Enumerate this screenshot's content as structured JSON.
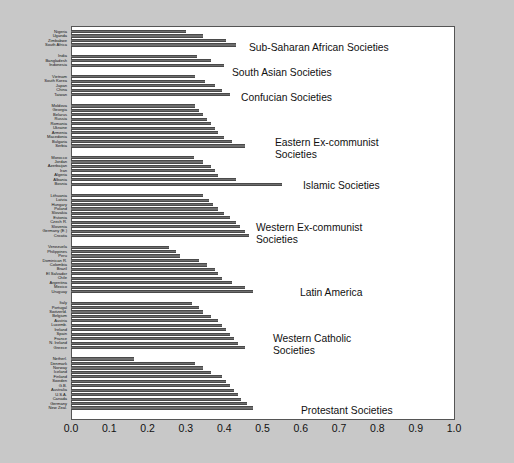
{
  "chart_data": {
    "type": "bar",
    "orientation": "horizontal",
    "title": "",
    "xlabel": "",
    "ylabel": "",
    "xlim": [
      0.0,
      1.0
    ],
    "grid": false,
    "legend": "none",
    "xticks": [
      "0.0",
      "0.1",
      "0.2",
      "0.3",
      "0.4",
      "0.5",
      "0.6",
      "0.7",
      "0.8",
      "0.9",
      "1.0"
    ],
    "xtick_values": [
      0.0,
      0.1,
      0.2,
      0.3,
      0.4,
      0.5,
      0.6,
      0.7,
      0.8,
      0.9,
      1.0
    ],
    "bar_color": "#6e6e6e",
    "groups": [
      {
        "name": "Sub-Saharan African Societies",
        "annotation": "Sub-Saharan African Societies",
        "categories": [
          "Nigeria",
          "Uganda",
          "Zimbabwe",
          "South Africa"
        ],
        "values": [
          0.3,
          0.345,
          0.405,
          0.43
        ]
      },
      {
        "name": "South Asian Societies",
        "annotation": "South Asian Societies",
        "categories": [
          "India",
          "Bangladesh",
          "Indonesia"
        ],
        "values": [
          0.33,
          0.365,
          0.4
        ]
      },
      {
        "name": "Confucian Societies",
        "annotation": "Confucian Societies",
        "categories": [
          "Vietnam",
          "South Korea",
          "Japan",
          "China",
          "Taiwan"
        ],
        "values": [
          0.325,
          0.35,
          0.375,
          0.395,
          0.415
        ]
      },
      {
        "name": "Eastern Ex-communist Societies",
        "annotation": "Eastern Ex-communist\nSocieties",
        "categories": [
          "Moldova",
          "Georgia",
          "Belarus",
          "Russia",
          "Romania",
          "Ukraine",
          "Armenia",
          "Macedonia",
          "Bulgaria",
          "Serbia"
        ],
        "values": [
          0.325,
          0.335,
          0.345,
          0.355,
          0.365,
          0.375,
          0.385,
          0.4,
          0.42,
          0.455
        ]
      },
      {
        "name": "Islamic Societies",
        "annotation": "Islamic Societies",
        "categories": [
          "Morocco",
          "Jordan",
          "Azerbaijan",
          "Iran",
          "Algeria",
          "Albania",
          "Bosnia"
        ],
        "values": [
          0.32,
          0.345,
          0.365,
          0.375,
          0.385,
          0.43,
          0.55
        ]
      },
      {
        "name": "Western Ex-communist Societies",
        "annotation": "Western Ex-communist\nSocieties",
        "categories": [
          "Lithuania",
          "Latvia",
          "Hungary",
          "Poland",
          "Slovakia",
          "Estonia",
          "Czech R.",
          "Slovenia",
          "Germany (E.)",
          "Croatia"
        ],
        "values": [
          0.345,
          0.36,
          0.37,
          0.385,
          0.4,
          0.415,
          0.43,
          0.44,
          0.455,
          0.465
        ]
      },
      {
        "name": "Latin America",
        "annotation": "Latin America",
        "categories": [
          "Venezuela",
          "Philippines",
          "Peru",
          "Dominican R.",
          "Colombia",
          "Brazil",
          "El Salvador",
          "Chile",
          "Argentina",
          "Mexico",
          "Uruguay"
        ],
        "values": [
          0.255,
          0.275,
          0.285,
          0.335,
          0.355,
          0.375,
          0.385,
          0.395,
          0.42,
          0.455,
          0.475
        ]
      },
      {
        "name": "Western Catholic Societies",
        "annotation": "Western Catholic\nSocieties",
        "categories": [
          "Italy",
          "Portugal",
          "Switzerld.",
          "Belgium",
          "Austria",
          "Luxemb.",
          "Ireland",
          "Spain",
          "France",
          "N. Ireland",
          "Greece"
        ],
        "values": [
          0.315,
          0.335,
          0.345,
          0.365,
          0.385,
          0.395,
          0.405,
          0.415,
          0.425,
          0.435,
          0.455
        ]
      },
      {
        "name": "Protestant Societies",
        "annotation": "Protestant Societies",
        "categories": [
          "Netherl.",
          "Denmark",
          "Norway",
          "Iceland",
          "Finland",
          "Sweden",
          "G.B.",
          "Australia",
          "U.S.A.",
          "Canada",
          "Germany",
          "New Zeal."
        ],
        "values": [
          0.165,
          0.325,
          0.345,
          0.365,
          0.395,
          0.405,
          0.415,
          0.425,
          0.435,
          0.445,
          0.46,
          0.475
        ]
      }
    ],
    "annotation_positions": [
      {
        "label": "Sub-Saharan African Societies",
        "x": 249,
        "y": 42
      },
      {
        "label": "South Asian Societies",
        "x": 232,
        "y": 67
      },
      {
        "label": "Confucian Societies",
        "x": 241,
        "y": 92
      },
      {
        "label": "Eastern Ex-communist\nSocieties",
        "x": 275,
        "y": 137
      },
      {
        "label": "Islamic Societies",
        "x": 303,
        "y": 180
      },
      {
        "label": "Western Ex-communist\nSocieties",
        "x": 256,
        "y": 222
      },
      {
        "label": "Latin America",
        "x": 300,
        "y": 287
      },
      {
        "label": "Western Catholic\nSocieties",
        "x": 273,
        "y": 333
      },
      {
        "label": "Protestant Societies",
        "x": 301,
        "y": 405
      }
    ]
  }
}
